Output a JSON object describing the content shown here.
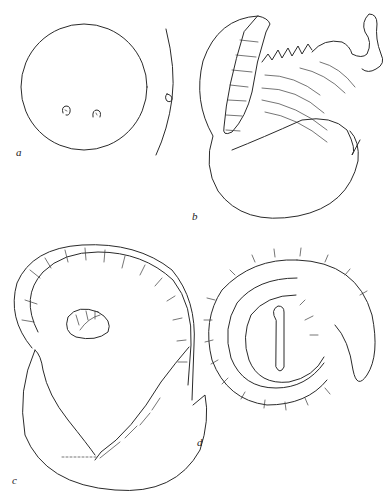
{
  "figure": {
    "panels": [
      {
        "id": "a",
        "label": "a",
        "subject": "spherical egg with two small embryonic markings and adjacent membrane"
      },
      {
        "id": "b",
        "label": "b",
        "subject": "hatching larva emerging from ruptured egg capsule, fringed/striated body"
      },
      {
        "id": "c",
        "label": "c",
        "subject": "coiled segmented larva emerging from split egg shell"
      },
      {
        "id": "d",
        "label": "d",
        "subject": "fully coiled segmented larva with spine rows"
      }
    ],
    "colors": {
      "background": "#ffffff",
      "ink": "#2a2a2a"
    }
  }
}
